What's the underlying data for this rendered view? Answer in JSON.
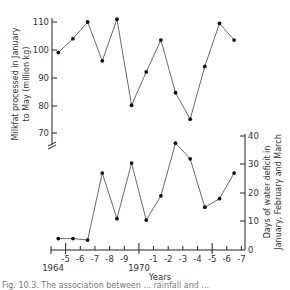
{
  "chart_data": [
    {
      "type": "line",
      "title": "",
      "xlabel": "Years",
      "ylabel": "Milkfat processed in January to May (million kg)",
      "ylim": [
        70,
        110
      ],
      "yticks": [
        70,
        80,
        90,
        100,
        110
      ],
      "axis_break": true,
      "grid": false,
      "categories": [
        "1964-65",
        "1965-66",
        "1966-67",
        "1967-68",
        "1968-69",
        "1969-70",
        "1970-71",
        "1971-72",
        "1972-73",
        "1973-74",
        "1974-75",
        "1975-76",
        "1976-77"
      ],
      "x": [
        1964.5,
        1965.5,
        1966.5,
        1967.5,
        1968.5,
        1969.5,
        1970.5,
        1971.5,
        1972.5,
        1973.5,
        1974.5,
        1975.5,
        1976.5
      ],
      "values": [
        99,
        104,
        110,
        96,
        111,
        80,
        92,
        103.5,
        84.5,
        75,
        94,
        109.5,
        103.5
      ]
    },
    {
      "type": "line",
      "title": "",
      "xlabel": "Years",
      "ylabel": "Days of water deficit in January, February and March",
      "ylim": [
        0,
        40
      ],
      "yticks": [
        0,
        10,
        20,
        30,
        40
      ],
      "grid": false,
      "categories": [
        "1964-65",
        "1965-66",
        "1966-67",
        "1967-68",
        "1968-69",
        "1969-70",
        "1970-71",
        "1971-72",
        "1972-73",
        "1973-74",
        "1974-75",
        "1975-76",
        "1976-77"
      ],
      "x": [
        1964.5,
        1965.5,
        1966.5,
        1967.5,
        1968.5,
        1969.5,
        1970.5,
        1971.5,
        1972.5,
        1973.5,
        1974.5,
        1975.5,
        1976.5
      ],
      "values": [
        4,
        4,
        3.5,
        27,
        11,
        30.5,
        10.5,
        19,
        37.5,
        32,
        15,
        18,
        27
      ]
    }
  ],
  "figure": {
    "upper_ylabel_line1": "Milkfat processed in January",
    "upper_ylabel_line2": "to May (million kg)",
    "lower_ylabel_line1": "Days of water deficit in",
    "lower_ylabel_line2": "January, February and March",
    "xaxis_label": "Years",
    "year_label_1964": "1964",
    "year_label_1970": "1970",
    "xtick_labels": [
      "-5",
      "-6",
      "-7",
      "-8",
      "-9",
      "-1",
      "-2",
      "-3",
      "-4",
      "-5",
      "-6",
      "-7"
    ],
    "upper_ytick_labels": [
      "110",
      "100",
      "90",
      "80",
      "70"
    ],
    "lower_ytick_labels": [
      "40",
      "30",
      "20",
      "10",
      "0"
    ],
    "caption": "Fig. 10.3. The association between ... rainfall and ..."
  }
}
